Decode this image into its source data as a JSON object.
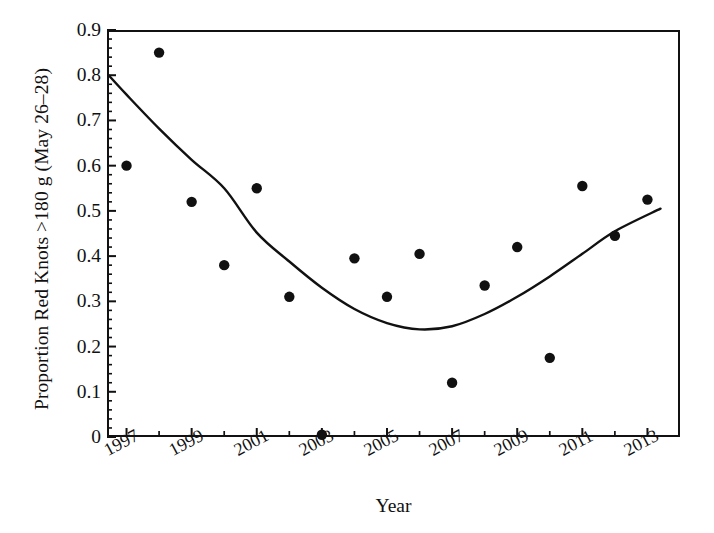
{
  "chart_data": {
    "type": "scatter",
    "title": "",
    "xlabel": "Year",
    "ylabel": "Proportion Red Knots >180 g (May 26–28)",
    "xlim": [
      1996.4,
      2014.0
    ],
    "ylim": [
      0,
      0.9
    ],
    "grid": false,
    "legend": "none",
    "xticklabels": [
      "1997",
      "1999",
      "2001",
      "2003",
      "2005",
      "2007",
      "2009",
      "2011",
      "2013"
    ],
    "xtickvalues": [
      1997,
      1999,
      2001,
      2003,
      2005,
      2007,
      2009,
      2011,
      2013
    ],
    "xminorticks": [
      1998,
      2000,
      2002,
      2004,
      2006,
      2008,
      2010,
      2012
    ],
    "yticklabels": [
      "0",
      "0.1",
      "0.2",
      "0.3",
      "0.4",
      "0.5",
      "0.6",
      "0.7",
      "0.8",
      "0.9"
    ],
    "ytickvalues": [
      0,
      0.1,
      0.2,
      0.3,
      0.4,
      0.5,
      0.6,
      0.7,
      0.8,
      0.9
    ],
    "yminortickstep": 0.02,
    "marker": "filled-circle",
    "marker_color": "#111111",
    "line_color": "#111111",
    "x": [
      1997,
      1998,
      1999,
      2000,
      2001,
      2002,
      2003,
      2004,
      2005,
      2006,
      2007,
      2008,
      2009,
      2010,
      2011,
      2012,
      2013
    ],
    "values": [
      0.6,
      0.85,
      0.52,
      0.38,
      0.55,
      0.31,
      0.005,
      0.395,
      0.31,
      0.405,
      0.12,
      0.335,
      0.42,
      0.175,
      0.555,
      0.445,
      0.525
    ],
    "series": [
      {
        "name": "Proportion Red Knots >180 g",
        "type": "scatter",
        "points": [
          {
            "x": 1997,
            "y": 0.6
          },
          {
            "x": 1998,
            "y": 0.85
          },
          {
            "x": 1999,
            "y": 0.52
          },
          {
            "x": 2000,
            "y": 0.38
          },
          {
            "x": 2001,
            "y": 0.55
          },
          {
            "x": 2002,
            "y": 0.31
          },
          {
            "x": 2003,
            "y": 0.005
          },
          {
            "x": 2004,
            "y": 0.395
          },
          {
            "x": 2005,
            "y": 0.31
          },
          {
            "x": 2006,
            "y": 0.405
          },
          {
            "x": 2007,
            "y": 0.12
          },
          {
            "x": 2008,
            "y": 0.335
          },
          {
            "x": 2009,
            "y": 0.42
          },
          {
            "x": 2010,
            "y": 0.175
          },
          {
            "x": 2011,
            "y": 0.555
          },
          {
            "x": 2012,
            "y": 0.445
          },
          {
            "x": 2013,
            "y": 0.525
          }
        ]
      },
      {
        "name": "fitted quadratic trend",
        "type": "line",
        "x_start": 1996.45,
        "x_end": 2013.4,
        "vertex_x": 2005.9,
        "vertex_y": 0.238,
        "y_start": 0.8,
        "y_end": 0.5,
        "curve_points": [
          {
            "x": 1996.45,
            "y": 0.8
          },
          {
            "x": 1997.0,
            "y": 0.757
          },
          {
            "x": 1998.0,
            "y": 0.682
          },
          {
            "x": 1999.0,
            "y": 0.613
          },
          {
            "x": 2000.0,
            "y": 0.55
          },
          {
            "x": 2001.0,
            "y": 0.452
          },
          {
            "x": 2002.0,
            "y": 0.388
          },
          {
            "x": 2003.0,
            "y": 0.33
          },
          {
            "x": 2004.0,
            "y": 0.283
          },
          {
            "x": 2005.0,
            "y": 0.252
          },
          {
            "x": 2006.0,
            "y": 0.238
          },
          {
            "x": 2007.0,
            "y": 0.245
          },
          {
            "x": 2008.0,
            "y": 0.272
          },
          {
            "x": 2009.0,
            "y": 0.31
          },
          {
            "x": 2010.0,
            "y": 0.355
          },
          {
            "x": 2011.0,
            "y": 0.405
          },
          {
            "x": 2012.0,
            "y": 0.455
          },
          {
            "x": 2013.4,
            "y": 0.505
          }
        ]
      }
    ]
  }
}
